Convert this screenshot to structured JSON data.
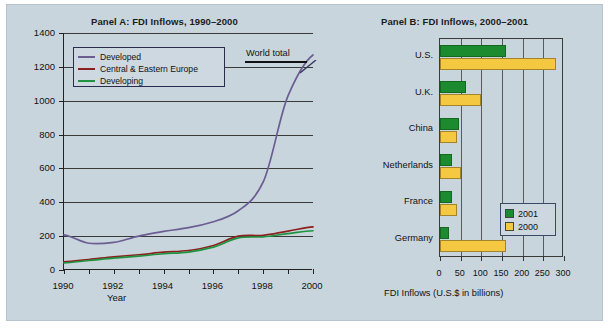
{
  "figure": {
    "background_color": "#c9d5dd"
  },
  "panelA": {
    "title": "Panel A: FDI Inflows, 1990–2000",
    "xlabel": "Year",
    "ylabel": "FDI Inflows (U.S.$ in billions)",
    "annotation": "World total",
    "yticks": [
      "0",
      "200",
      "400",
      "600",
      "800",
      "1000",
      "1200",
      "1400"
    ],
    "xticks": [
      "1990",
      "1992",
      "1994",
      "1996",
      "1998",
      "2000"
    ],
    "legend": [
      {
        "label": "Developed",
        "color": "#6b5d92"
      },
      {
        "label": "Central & Eastern Europe",
        "color": "#8d1f1f"
      },
      {
        "label": "Developing",
        "color": "#1f9440"
      }
    ]
  },
  "panelB": {
    "title": "Panel B: FDI Inflows, 2000–2001",
    "xlabel": "FDI Inflows (U.S.$ in billions)",
    "xticks": [
      "0",
      "50",
      "100",
      "150",
      "200",
      "250",
      "300"
    ],
    "legend": [
      {
        "label": "2001",
        "color": "#1c8a2e"
      },
      {
        "label": "2000",
        "color": "#f5c842"
      }
    ]
  },
  "chart_data": [
    {
      "type": "line",
      "title": "Panel A: FDI Inflows, 1990–2000",
      "xlabel": "Year",
      "ylabel": "FDI Inflows (U.S.$ in billions)",
      "xlim": [
        1990,
        2000
      ],
      "ylim": [
        0,
        1400
      ],
      "ytick_step": 200,
      "grid": "horizontal",
      "legend_position": "upper-left",
      "annotations": [
        "World total"
      ],
      "x": [
        1990,
        1991,
        1992,
        1993,
        1994,
        1995,
        1996,
        1997,
        1998,
        1999,
        2000
      ],
      "series": [
        {
          "name": "Developed",
          "color": "#6b5d92",
          "values": [
            208,
            158,
            163,
            200,
            228,
            250,
            285,
            350,
            520,
            1030,
            1270
          ]
        },
        {
          "name": "Central & Eastern Europe",
          "color": "#8d1f1f",
          "values": [
            48,
            62,
            78,
            90,
            105,
            115,
            145,
            200,
            205,
            230,
            255
          ]
        },
        {
          "name": "Developing",
          "color": "#1f9440",
          "values": [
            42,
            56,
            70,
            82,
            96,
            106,
            135,
            190,
            196,
            215,
            232
          ]
        }
      ]
    },
    {
      "type": "bar",
      "orientation": "horizontal",
      "title": "Panel B: FDI Inflows, 2000–2001",
      "xlabel": "FDI Inflows (U.S.$ in billions)",
      "ylabel": "",
      "xlim": [
        0,
        300
      ],
      "xtick_step": 50,
      "grid": "vertical",
      "legend_position": "lower-right",
      "categories": [
        "U.S.",
        "U.K.",
        "China",
        "Netherlands",
        "France",
        "Germany"
      ],
      "series": [
        {
          "name": "2001",
          "color": "#1c8a2e",
          "values": [
            160,
            62,
            47,
            30,
            30,
            21
          ]
        },
        {
          "name": "2000",
          "color": "#f5c842",
          "values": [
            280,
            100,
            41,
            50,
            42,
            160
          ]
        }
      ]
    }
  ]
}
